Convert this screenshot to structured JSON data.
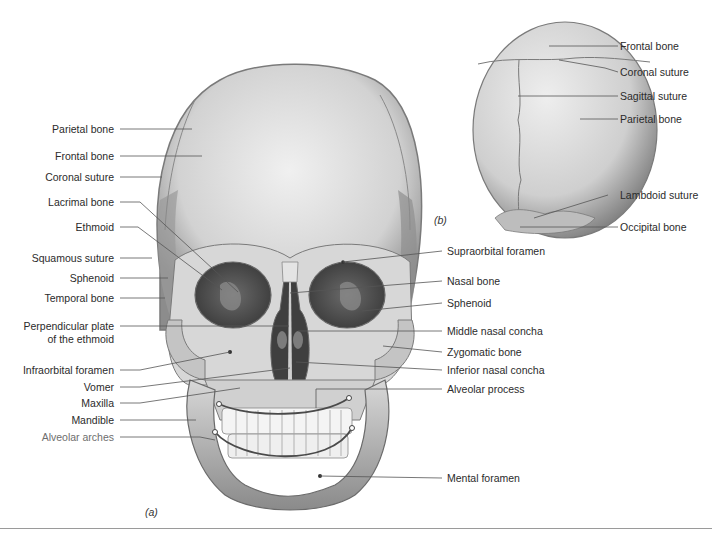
{
  "figure": {
    "panel_a_label": "(a)",
    "panel_b_label": "(b)",
    "panel_a": {
      "left_labels": [
        {
          "id": "parietal",
          "text": "Parietal bone"
        },
        {
          "id": "frontal",
          "text": "Frontal bone"
        },
        {
          "id": "coronal",
          "text": "Coronal suture"
        },
        {
          "id": "lacrimal",
          "text": "Lacrimal bone"
        },
        {
          "id": "ethmoid",
          "text": "Ethmoid"
        },
        {
          "id": "squamous",
          "text": "Squamous suture"
        },
        {
          "id": "sphenoid",
          "text": "Sphenoid"
        },
        {
          "id": "temporal",
          "text": "Temporal bone"
        },
        {
          "id": "perp1",
          "text": "Perpendicular plate"
        },
        {
          "id": "perp2",
          "text": "of the ethmoid"
        },
        {
          "id": "infraorbital",
          "text": "Infraorbital foramen"
        },
        {
          "id": "vomer",
          "text": "Vomer"
        },
        {
          "id": "maxilla",
          "text": "Maxilla"
        },
        {
          "id": "mandible",
          "text": "Mandible"
        },
        {
          "id": "alveolar_arches",
          "text": "Alveolar arches"
        }
      ],
      "right_labels": [
        {
          "id": "supraorbital",
          "text": "Supraorbital foramen"
        },
        {
          "id": "nasal",
          "text": "Nasal bone"
        },
        {
          "id": "sphenoid_r",
          "text": "Sphenoid"
        },
        {
          "id": "middle_concha",
          "text": "Middle nasal concha"
        },
        {
          "id": "zygomatic",
          "text": "Zygomatic bone"
        },
        {
          "id": "inferior_concha",
          "text": "Inferior nasal concha"
        },
        {
          "id": "alveolar_process",
          "text": "Alveolar process"
        },
        {
          "id": "mental",
          "text": "Mental foramen"
        }
      ]
    },
    "panel_b": {
      "labels": [
        {
          "id": "b_frontal",
          "text": "Frontal bone"
        },
        {
          "id": "b_coronal",
          "text": "Coronal suture"
        },
        {
          "id": "b_sagittal",
          "text": "Sagittal suture"
        },
        {
          "id": "b_parietal",
          "text": "Parietal bone"
        },
        {
          "id": "b_lambdoid",
          "text": "Lambdoid suture"
        },
        {
          "id": "b_occipital",
          "text": "Occipital bone"
        }
      ]
    },
    "colors": {
      "bone_light": "#e6e6e6",
      "bone_mid": "#b9b9b9",
      "bone_dark": "#6f6f6f",
      "cavity": "#4a4a4a",
      "leader": "#555555",
      "text": "#2b2b2b",
      "rule": "#9a9a9a"
    }
  }
}
